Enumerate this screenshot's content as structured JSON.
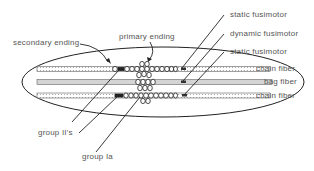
{
  "diagram": {
    "type": "muscle spindle schematic",
    "labels": {
      "secondary_ending": "secondary  ending",
      "primary_ending": "primary  ending",
      "static_fusimotor_top": "static  fusimotor",
      "dynamic_fusimotor": "dynamic  fusimotor",
      "static_fusimotor_bottom": "static  fusimotor",
      "chain_fiber_top": "chain  fiber",
      "bag_fiber": "bag  fiber",
      "chain_fiber_bottom": "chain  fiber",
      "group_II": "group  II's",
      "group_Ia": "group  Ia"
    },
    "colors": {
      "line": "#222222",
      "text": "#555555",
      "fiber_fill": "#d8d8d8",
      "fiber_stroke": "#777777",
      "background": "#ffffff"
    }
  }
}
